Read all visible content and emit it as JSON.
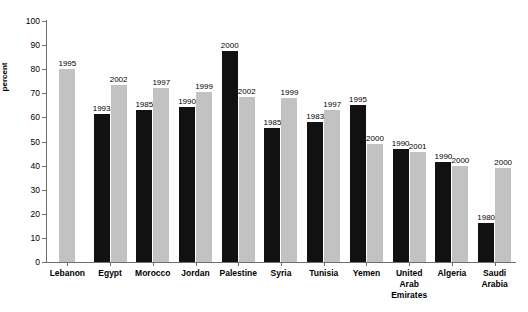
{
  "chart_data": {
    "type": "bar",
    "title": "",
    "xlabel": "",
    "ylabel": "percent",
    "ylim": [
      0,
      100
    ],
    "yticks": [
      0,
      10,
      20,
      30,
      40,
      50,
      60,
      70,
      80,
      90,
      100
    ],
    "grid": false,
    "legend": "none",
    "categories": [
      "Lebanon",
      "Egypt",
      "Morocco",
      "Jordan",
      "Palestine",
      "Syria",
      "Tunisia",
      "Yemen",
      "United Arab Emirates",
      "Algeria",
      "Saudi Arabia"
    ],
    "category_lines": [
      [
        "Lebanon"
      ],
      [
        "Egypt"
      ],
      [
        "Morocco"
      ],
      [
        "Jordan"
      ],
      [
        "Palestine"
      ],
      [
        "Syria"
      ],
      [
        "Tunisia"
      ],
      [
        "Yemen"
      ],
      [
        "United",
        "Arab",
        "Emirates"
      ],
      [
        "Algeria"
      ],
      [
        "Saudi",
        "Arabia"
      ]
    ],
    "colors": {
      "dark": "#111111",
      "light": "#c2c2c2",
      "axis": "#6e6e6e",
      "text": "#000000",
      "background": "#ffffff"
    },
    "groups": [
      {
        "category": "Lebanon",
        "bars": [
          {
            "year": "1995",
            "value": 80,
            "color": "light"
          }
        ]
      },
      {
        "category": "Egypt",
        "bars": [
          {
            "year": "1993",
            "value": 61.5,
            "color": "dark"
          },
          {
            "year": "2002",
            "value": 73.5,
            "color": "light"
          }
        ]
      },
      {
        "category": "Morocco",
        "bars": [
          {
            "year": "1985",
            "value": 63,
            "color": "dark"
          },
          {
            "year": "1997",
            "value": 72,
            "color": "light"
          }
        ]
      },
      {
        "category": "Jordan",
        "bars": [
          {
            "year": "1990",
            "value": 64.5,
            "color": "dark"
          },
          {
            "year": "1999",
            "value": 70.5,
            "color": "light"
          }
        ]
      },
      {
        "category": "Palestine",
        "bars": [
          {
            "year": "2000",
            "value": 87.5,
            "color": "dark"
          },
          {
            "year": "2002",
            "value": 68.5,
            "color": "light"
          }
        ]
      },
      {
        "category": "Syria",
        "bars": [
          {
            "year": "1985",
            "value": 55.5,
            "color": "dark"
          },
          {
            "year": "1999",
            "value": 68,
            "color": "light"
          }
        ]
      },
      {
        "category": "Tunisia",
        "bars": [
          {
            "year": "1983",
            "value": 58,
            "color": "dark"
          },
          {
            "year": "1997",
            "value": 63,
            "color": "light"
          }
        ]
      },
      {
        "category": "Yemen",
        "bars": [
          {
            "year": "1995",
            "value": 65,
            "color": "dark"
          },
          {
            "year": "2000",
            "value": 49,
            "color": "light"
          }
        ]
      },
      {
        "category": "United Arab Emirates",
        "bars": [
          {
            "year": "1990",
            "value": 47,
            "color": "dark"
          },
          {
            "year": "2001",
            "value": 45.5,
            "color": "light"
          }
        ]
      },
      {
        "category": "Algeria",
        "bars": [
          {
            "year": "1990",
            "value": 41.5,
            "color": "dark"
          },
          {
            "year": "2000",
            "value": 40,
            "color": "light"
          }
        ]
      },
      {
        "category": "Saudi Arabia",
        "bars": [
          {
            "year": "1980",
            "value": 16,
            "color": "dark"
          },
          {
            "year": "2000",
            "value": 39,
            "color": "light"
          }
        ]
      }
    ]
  }
}
